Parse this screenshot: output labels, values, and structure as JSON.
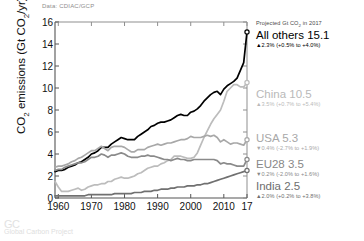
{
  "source_note": "Data: CDIAC/GCP",
  "watermark": {
    "main": "GC",
    "sub": "Global Carbon Project"
  },
  "axes": {
    "ylabel": "CO2 emissions (Gt CO2/yr)",
    "ylabel_prefix": "CO",
    "ylabel_mid": " emissions (Gt CO",
    "ylabel_suffix": "/yr)",
    "ysub": "2",
    "yticks": [
      "0",
      "2",
      "4",
      "6",
      "8",
      "10",
      "12",
      "14",
      "16"
    ],
    "xticks": [
      "1960",
      "1970",
      "1980",
      "1990",
      "2000",
      "2010",
      "17"
    ]
  },
  "legend": {
    "projected_note_a": "Projected Gt CO",
    "projected_note_sub": "2",
    "projected_note_b": " in 2017",
    "items": [
      {
        "name": "All others 15.1",
        "change": "▲2.3% (+0.5% to +4.0%)",
        "color": "#000000"
      },
      {
        "name": "China 10.5",
        "change": "▲3.5% (+0.7% to +5.4%)",
        "color": "#b9b9b9"
      },
      {
        "name": "USA 5.3",
        "change": "▼0.4% (-2.7% to +1.9%)",
        "color": "#a8a8a8"
      },
      {
        "name": "EU28 3.5",
        "change": "▼0.2% (-2.0% to +1.6%)",
        "color": "#888888"
      },
      {
        "name": "India 2.5",
        "change": "▲2.0% (+0.2% to +3.8%)",
        "color": "#6e6e6e"
      }
    ]
  },
  "chart_data": {
    "type": "line",
    "title": "",
    "xlabel": "",
    "ylabel": "CO2 emissions (Gt CO2/yr)",
    "xlim": [
      1959,
      2017
    ],
    "ylim": [
      0,
      16
    ],
    "grid": false,
    "legend_position": "right",
    "x": [
      1959,
      1960,
      1961,
      1962,
      1963,
      1964,
      1965,
      1966,
      1967,
      1968,
      1969,
      1970,
      1971,
      1972,
      1973,
      1974,
      1975,
      1976,
      1977,
      1978,
      1979,
      1980,
      1981,
      1982,
      1983,
      1984,
      1985,
      1986,
      1987,
      1988,
      1989,
      1990,
      1991,
      1992,
      1993,
      1994,
      1995,
      1996,
      1997,
      1998,
      1999,
      2000,
      2001,
      2002,
      2003,
      2004,
      2005,
      2006,
      2007,
      2008,
      2009,
      2010,
      2011,
      2012,
      2013,
      2014,
      2015,
      2016,
      2017
    ],
    "series": [
      {
        "name": "All others",
        "color": "#000000",
        "projected_2017": 15.1,
        "values": [
          2.4,
          2.5,
          2.5,
          2.6,
          2.8,
          2.9,
          3.0,
          3.2,
          3.3,
          3.5,
          3.7,
          4.0,
          4.1,
          4.3,
          4.6,
          4.6,
          4.6,
          4.9,
          5.1,
          5.3,
          5.5,
          5.4,
          5.3,
          5.3,
          5.3,
          5.6,
          5.8,
          6.0,
          6.2,
          6.5,
          6.6,
          6.8,
          6.9,
          6.9,
          7.0,
          7.1,
          7.3,
          7.5,
          7.6,
          7.5,
          7.5,
          7.8,
          7.9,
          8.1,
          8.4,
          8.8,
          9.1,
          9.4,
          9.6,
          9.7,
          9.4,
          9.9,
          10.2,
          10.4,
          10.6,
          10.9,
          11.6,
          12.3,
          15.1
        ]
      },
      {
        "name": "China",
        "color": "#bcbcbc",
        "projected_2017": 10.5,
        "values": [
          1.5,
          1.0,
          0.6,
          0.6,
          0.6,
          0.7,
          0.8,
          0.9,
          0.7,
          0.8,
          1.0,
          1.1,
          1.2,
          1.2,
          1.3,
          1.3,
          1.5,
          1.5,
          1.7,
          1.8,
          1.9,
          1.8,
          1.8,
          1.9,
          2.0,
          2.2,
          2.3,
          2.5,
          2.7,
          2.8,
          2.9,
          2.9,
          3.1,
          3.2,
          3.4,
          3.5,
          3.8,
          3.8,
          3.8,
          3.7,
          3.6,
          3.6,
          3.7,
          4.1,
          4.8,
          5.5,
          6.1,
          6.7,
          7.2,
          7.6,
          8.0,
          8.8,
          9.7,
          10.0,
          10.3,
          10.3,
          10.1,
          10.1,
          10.5
        ]
      },
      {
        "name": "USA",
        "color": "#a8a8a8",
        "projected_2017": 5.3,
        "values": [
          2.8,
          2.9,
          2.9,
          3.0,
          3.1,
          3.3,
          3.4,
          3.6,
          3.7,
          3.9,
          4.1,
          4.3,
          4.3,
          4.5,
          4.7,
          4.5,
          4.3,
          4.6,
          4.7,
          4.7,
          4.7,
          4.6,
          4.4,
          4.2,
          4.2,
          4.4,
          4.4,
          4.4,
          4.6,
          4.7,
          4.8,
          4.9,
          4.8,
          4.9,
          5.0,
          5.0,
          5.1,
          5.2,
          5.3,
          5.3,
          5.4,
          5.6,
          5.5,
          5.5,
          5.5,
          5.6,
          5.7,
          5.6,
          5.7,
          5.5,
          5.1,
          5.3,
          5.1,
          4.9,
          5.0,
          5.0,
          4.9,
          4.8,
          5.3
        ]
      },
      {
        "name": "EU28",
        "color": "#8a8a8a",
        "projected_2017": 3.5,
        "values": [
          2.5,
          2.6,
          2.6,
          2.8,
          2.9,
          3.0,
          3.1,
          3.2,
          3.2,
          3.3,
          3.5,
          3.7,
          3.7,
          3.8,
          4.0,
          3.9,
          3.7,
          3.9,
          3.9,
          4.0,
          4.1,
          4.0,
          3.8,
          3.7,
          3.7,
          3.7,
          3.8,
          3.8,
          3.9,
          3.8,
          3.8,
          3.7,
          3.6,
          3.5,
          3.5,
          3.4,
          3.5,
          3.6,
          3.5,
          3.5,
          3.4,
          3.4,
          3.5,
          3.5,
          3.5,
          3.5,
          3.5,
          3.5,
          3.5,
          3.4,
          3.1,
          3.2,
          3.1,
          3.1,
          3.0,
          2.9,
          2.9,
          2.9,
          3.5
        ]
      },
      {
        "name": "India",
        "color": "#707070",
        "projected_2017": 2.5,
        "values": [
          0.2,
          0.2,
          0.2,
          0.2,
          0.2,
          0.2,
          0.2,
          0.2,
          0.2,
          0.2,
          0.3,
          0.3,
          0.3,
          0.3,
          0.3,
          0.3,
          0.3,
          0.3,
          0.4,
          0.4,
          0.4,
          0.4,
          0.4,
          0.4,
          0.5,
          0.5,
          0.5,
          0.6,
          0.6,
          0.6,
          0.7,
          0.7,
          0.8,
          0.8,
          0.8,
          0.9,
          0.9,
          1.0,
          1.0,
          1.0,
          1.1,
          1.1,
          1.1,
          1.2,
          1.2,
          1.3,
          1.3,
          1.4,
          1.5,
          1.6,
          1.7,
          1.8,
          1.9,
          2.0,
          2.1,
          2.2,
          2.3,
          2.4,
          2.5
        ]
      }
    ]
  }
}
